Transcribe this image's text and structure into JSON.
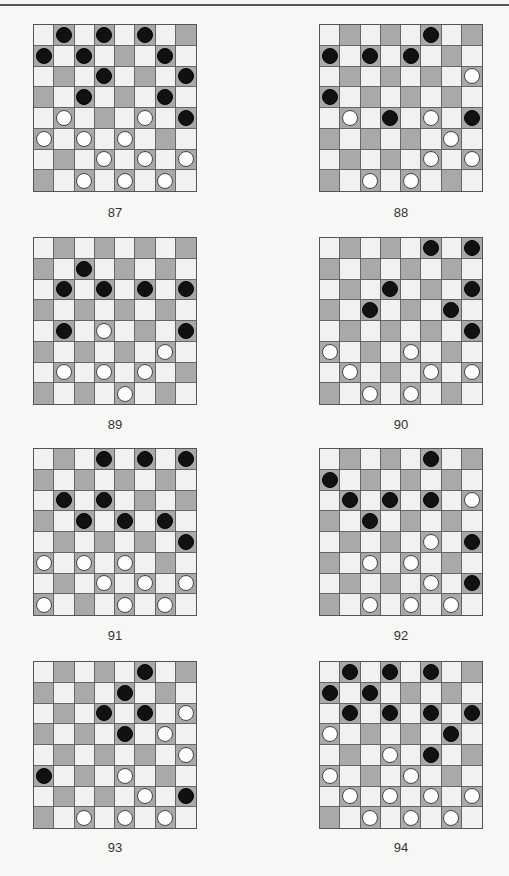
{
  "page": {
    "colors": {
      "light_square": "#f1f1ef",
      "dark_square": "#a9a9a7",
      "black_piece": "#111111",
      "white_piece": "#fdfdfb"
    }
  },
  "diagrams": [
    {
      "label": "87",
      "black": [
        [
          0,
          1
        ],
        [
          0,
          3
        ],
        [
          0,
          5
        ],
        [
          1,
          0
        ],
        [
          1,
          2
        ],
        [
          1,
          6
        ],
        [
          2,
          3
        ],
        [
          2,
          7
        ],
        [
          3,
          2
        ],
        [
          3,
          6
        ],
        [
          4,
          7
        ]
      ],
      "white": [
        [
          4,
          1
        ],
        [
          4,
          5
        ],
        [
          5,
          0
        ],
        [
          5,
          2
        ],
        [
          5,
          4
        ],
        [
          6,
          3
        ],
        [
          6,
          5
        ],
        [
          6,
          7
        ],
        [
          7,
          2
        ],
        [
          7,
          4
        ],
        [
          7,
          6
        ]
      ]
    },
    {
      "label": "88",
      "black": [
        [
          0,
          5
        ],
        [
          1,
          0
        ],
        [
          1,
          2
        ],
        [
          1,
          4
        ],
        [
          3,
          0
        ],
        [
          4,
          3
        ],
        [
          4,
          7
        ]
      ],
      "white": [
        [
          2,
          7
        ],
        [
          4,
          1
        ],
        [
          4,
          5
        ],
        [
          5,
          6
        ],
        [
          6,
          5
        ],
        [
          6,
          7
        ],
        [
          7,
          2
        ],
        [
          7,
          4
        ]
      ]
    },
    {
      "label": "89",
      "black": [
        [
          1,
          2
        ],
        [
          2,
          1
        ],
        [
          2,
          3
        ],
        [
          2,
          5
        ],
        [
          2,
          7
        ],
        [
          4,
          1
        ],
        [
          4,
          7
        ]
      ],
      "white": [
        [
          4,
          3
        ],
        [
          5,
          6
        ],
        [
          6,
          1
        ],
        [
          6,
          3
        ],
        [
          6,
          5
        ],
        [
          7,
          4
        ]
      ]
    },
    {
      "label": "90",
      "black": [
        [
          0,
          5
        ],
        [
          0,
          7
        ],
        [
          2,
          3
        ],
        [
          2,
          7
        ],
        [
          3,
          2
        ],
        [
          3,
          6
        ],
        [
          4,
          7
        ]
      ],
      "white": [
        [
          5,
          0
        ],
        [
          5,
          4
        ],
        [
          6,
          1
        ],
        [
          6,
          5
        ],
        [
          6,
          7
        ],
        [
          7,
          2
        ],
        [
          7,
          4
        ]
      ]
    },
    {
      "label": "91",
      "black": [
        [
          0,
          3
        ],
        [
          0,
          5
        ],
        [
          0,
          7
        ],
        [
          2,
          1
        ],
        [
          2,
          3
        ],
        [
          3,
          2
        ],
        [
          3,
          4
        ],
        [
          3,
          6
        ],
        [
          4,
          7
        ]
      ],
      "white": [
        [
          5,
          0
        ],
        [
          5,
          2
        ],
        [
          5,
          4
        ],
        [
          6,
          3
        ],
        [
          6,
          5
        ],
        [
          6,
          7
        ],
        [
          7,
          0
        ],
        [
          7,
          4
        ],
        [
          7,
          6
        ]
      ]
    },
    {
      "label": "92",
      "black": [
        [
          0,
          5
        ],
        [
          1,
          0
        ],
        [
          2,
          1
        ],
        [
          2,
          3
        ],
        [
          2,
          5
        ],
        [
          3,
          2
        ],
        [
          4,
          7
        ],
        [
          6,
          7
        ]
      ],
      "white": [
        [
          2,
          7
        ],
        [
          4,
          5
        ],
        [
          5,
          2
        ],
        [
          5,
          4
        ],
        [
          6,
          5
        ],
        [
          7,
          2
        ],
        [
          7,
          4
        ],
        [
          7,
          6
        ]
      ]
    },
    {
      "label": "93",
      "black": [
        [
          0,
          5
        ],
        [
          1,
          4
        ],
        [
          2,
          3
        ],
        [
          2,
          5
        ],
        [
          3,
          4
        ],
        [
          5,
          0
        ],
        [
          6,
          7
        ]
      ],
      "white": [
        [
          2,
          7
        ],
        [
          3,
          6
        ],
        [
          4,
          7
        ],
        [
          5,
          4
        ],
        [
          6,
          5
        ],
        [
          7,
          2
        ],
        [
          7,
          4
        ],
        [
          7,
          6
        ]
      ]
    },
    {
      "label": "94",
      "black": [
        [
          0,
          1
        ],
        [
          0,
          3
        ],
        [
          0,
          5
        ],
        [
          1,
          0
        ],
        [
          1,
          2
        ],
        [
          2,
          1
        ],
        [
          2,
          3
        ],
        [
          2,
          5
        ],
        [
          2,
          7
        ],
        [
          3,
          6
        ],
        [
          4,
          5
        ]
      ],
      "white": [
        [
          3,
          0
        ],
        [
          4,
          3
        ],
        [
          5,
          0
        ],
        [
          5,
          4
        ],
        [
          6,
          1
        ],
        [
          6,
          3
        ],
        [
          6,
          5
        ],
        [
          6,
          7
        ],
        [
          7,
          2
        ],
        [
          7,
          4
        ],
        [
          7,
          6
        ]
      ]
    }
  ]
}
